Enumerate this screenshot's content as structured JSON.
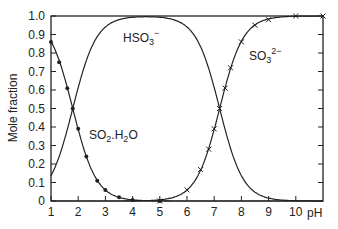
{
  "chart_data": {
    "type": "line",
    "title": "",
    "xlabel": "pH",
    "ylabel": "Mole fraction",
    "xlim": [
      1,
      11
    ],
    "ylim": [
      0,
      1.0
    ],
    "x_ticks": [
      "1",
      "2",
      "3",
      "4",
      "5",
      "6",
      "7",
      "8",
      "9",
      "10"
    ],
    "y_ticks": [
      "0",
      "0.1",
      "0.2",
      "0.3",
      "0.4",
      "0.5",
      "0.6",
      "0.7",
      "0.8",
      "0.9",
      "1.0"
    ],
    "grid": false,
    "legend": "none (inline labels)",
    "pKa1": 1.8,
    "pKa2": 7.2,
    "series": [
      {
        "name": "SO2.H2O",
        "label_main": "SO",
        "label_sub1": "2",
        "label_mid": ".H",
        "label_sub2": "2",
        "label_end": "O",
        "marker": "dot",
        "x": [
          1.0,
          1.3,
          1.6,
          1.8,
          2.0,
          2.3,
          2.7,
          3.0,
          3.5,
          4.0,
          5.0
        ],
        "values": [
          0.86,
          0.75,
          0.61,
          0.5,
          0.39,
          0.24,
          0.11,
          0.06,
          0.02,
          0.006,
          0.0
        ]
      },
      {
        "name": "HSO3-",
        "label_main": "HSO",
        "label_sub": "3",
        "label_sup": "−",
        "marker": "none",
        "x": [
          1.0,
          1.8,
          2.5,
          3.0,
          4.0,
          5.0,
          6.0,
          7.2,
          8.0,
          9.0,
          10.0
        ],
        "values": [
          0.14,
          0.5,
          0.83,
          0.94,
          0.99,
          1.0,
          0.94,
          0.5,
          0.14,
          0.016,
          0.0
        ]
      },
      {
        "name": "SO3 2-",
        "label_main": "SO",
        "label_sub": "3",
        "label_sup": "2−",
        "marker": "cross",
        "x": [
          5.0,
          6.0,
          6.5,
          6.8,
          7.0,
          7.2,
          7.4,
          7.6,
          8.0,
          8.5,
          9.0,
          10.0,
          11.0
        ],
        "values": [
          0.0,
          0.06,
          0.17,
          0.28,
          0.39,
          0.5,
          0.61,
          0.72,
          0.86,
          0.95,
          0.98,
          1.0,
          1.0
        ]
      }
    ]
  }
}
